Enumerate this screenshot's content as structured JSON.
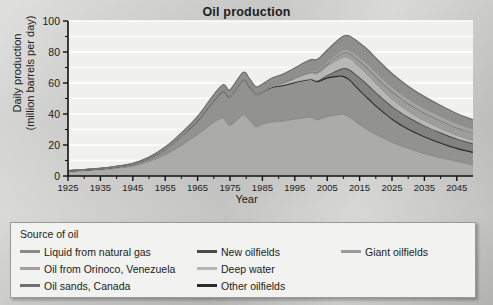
{
  "chart_data": {
    "type": "area",
    "title": "Oil production",
    "xlabel": "Year",
    "ylabel": "Daily production\n(million barrels per day)",
    "ylabel_line1": "Daily production",
    "ylabel_line2": "(million barrels per day)",
    "xlim": [
      1925,
      2050
    ],
    "ylim": [
      0,
      100
    ],
    "xticks": [
      1925,
      1935,
      1945,
      1955,
      1965,
      1975,
      1985,
      1995,
      2005,
      2015,
      2025,
      2035,
      2045
    ],
    "yticks": [
      0,
      20,
      40,
      60,
      80,
      100
    ],
    "yminorticks": [
      10,
      30,
      50,
      70,
      90
    ],
    "grid": "horizontal",
    "stacked": true,
    "legend_position": "below-plot",
    "x": [
      1925,
      1930,
      1935,
      1940,
      1945,
      1950,
      1955,
      1960,
      1965,
      1970,
      1973,
      1975,
      1979,
      1981,
      1983,
      1985,
      1988,
      1991,
      1994,
      1997,
      2000,
      2002,
      2005,
      2008,
      2010,
      2012,
      2015,
      2018,
      2020,
      2025,
      2030,
      2035,
      2040,
      2045,
      2050
    ],
    "series": [
      {
        "name": "Giant oilfields",
        "color": "#a8a8a6",
        "values": [
          3.0,
          3.6,
          4.2,
          5.2,
          6.5,
          9.5,
          14.0,
          20.0,
          27.0,
          35.0,
          37.5,
          33.0,
          39.5,
          36.5,
          32.0,
          33.5,
          35.0,
          35.5,
          36.5,
          37.5,
          38.0,
          36.5,
          38.5,
          39.5,
          40.0,
          38.0,
          33.5,
          29.5,
          27.0,
          22.0,
          18.0,
          14.5,
          12.0,
          9.5,
          7.5
        ]
      },
      {
        "name": "Other oilfields",
        "color": "#8e8e8c",
        "values": [
          0.3,
          0.4,
          0.5,
          0.8,
          1.2,
          2.0,
          3.5,
          6.0,
          9.0,
          14.0,
          17.5,
          18.5,
          22.5,
          21.5,
          21.0,
          21.0,
          22.5,
          23.0,
          23.5,
          24.0,
          24.5,
          24.5,
          25.0,
          25.0,
          24.5,
          24.0,
          22.0,
          20.0,
          18.5,
          15.0,
          12.5,
          11.0,
          9.5,
          8.5,
          8.0
        ]
      },
      {
        "name": "New oilfields",
        "color": "#7d7d7b",
        "values": [
          0,
          0,
          0,
          0,
          0,
          0,
          0,
          0,
          0,
          0,
          0,
          0,
          0,
          0,
          0,
          0,
          0,
          0,
          0,
          0,
          0,
          0.5,
          1.5,
          3.5,
          5.0,
          6.5,
          8.0,
          8.5,
          8.5,
          8.0,
          7.5,
          7.0,
          6.5,
          6.0,
          5.5
        ]
      },
      {
        "name": "Deep water",
        "color": "#b4b4b2",
        "values": [
          0,
          0,
          0,
          0,
          0,
          0,
          0,
          0,
          0,
          0,
          0,
          0,
          0,
          0,
          0,
          0,
          0.3,
          0.8,
          1.5,
          2.5,
          3.5,
          4.0,
          5.0,
          6.0,
          6.5,
          6.5,
          6.0,
          5.5,
          5.0,
          4.0,
          3.2,
          2.6,
          2.2,
          1.8,
          1.5
        ]
      },
      {
        "name": "Oil sands, Canada",
        "color": "#999997",
        "values": [
          0,
          0,
          0,
          0,
          0,
          0,
          0,
          0,
          0,
          0,
          0,
          0,
          0,
          0,
          0,
          0,
          0.2,
          0.4,
          0.7,
          1.0,
          1.3,
          1.6,
          2.2,
          3.0,
          3.5,
          4.0,
          4.5,
          5.0,
          5.2,
          5.5,
          5.6,
          5.6,
          5.5,
          5.4,
          5.2
        ]
      },
      {
        "name": "Oil from Orinoco, Venezuela",
        "color": "#a0a09e",
        "values": [
          0,
          0,
          0,
          0,
          0,
          0,
          0,
          0,
          0,
          0,
          0,
          0,
          0,
          0,
          0,
          0,
          0,
          0.2,
          0.4,
          0.6,
          0.8,
          1.0,
          1.3,
          1.6,
          1.8,
          2.0,
          2.3,
          2.5,
          2.6,
          2.8,
          2.9,
          2.9,
          2.8,
          2.7,
          2.6
        ]
      },
      {
        "name": "Liquid from natural gas",
        "color": "#8a8a88",
        "values": [
          0.1,
          0.1,
          0.2,
          0.3,
          0.4,
          0.7,
          1.2,
          1.8,
          2.5,
          3.5,
          4.0,
          4.2,
          4.8,
          4.8,
          4.6,
          4.8,
          5.2,
          5.5,
          6.0,
          6.5,
          7.0,
          7.2,
          7.8,
          8.5,
          9.0,
          9.2,
          9.5,
          9.5,
          9.3,
          8.8,
          8.2,
          7.6,
          7.0,
          6.4,
          6.0
        ]
      }
    ],
    "peak": {
      "year": 2010,
      "value": 92
    }
  },
  "legend": {
    "title": "Source of oil",
    "columns": [
      {
        "items": [
          {
            "label": "Liquid from natural gas",
            "color": "#8a8a88"
          },
          {
            "label": "Oil from Orinoco, Venezuela",
            "color": "#a0a09e"
          },
          {
            "label": "Oil sands, Canada",
            "color": "#6f6f6d"
          }
        ]
      },
      {
        "items": [
          {
            "label": "New oilfields",
            "color": "#4a4a48"
          },
          {
            "label": "Deep water",
            "color": "#b4b4b2"
          },
          {
            "label": "Other oilfields",
            "color": "#2b2b29"
          }
        ]
      },
      {
        "items": [
          {
            "label": "Giant oilfields",
            "color": "#9b9b99"
          }
        ]
      }
    ]
  }
}
